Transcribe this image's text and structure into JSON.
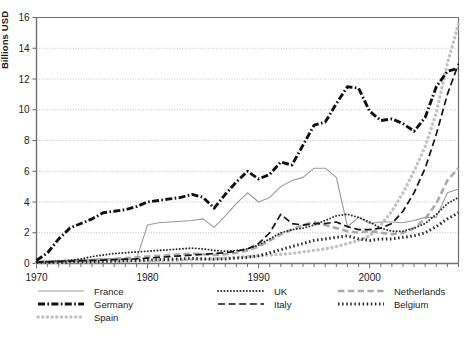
{
  "chart_data": {
    "type": "line",
    "title": "",
    "xlabel": "",
    "ylabel": "Billions USD",
    "xlim": [
      1970,
      2008
    ],
    "ylim": [
      0,
      16
    ],
    "yticks": [
      0,
      2,
      4,
      6,
      8,
      10,
      12,
      14,
      16
    ],
    "xticks_labeled": [
      1970,
      1980,
      1990,
      2000
    ],
    "xtick_step": 1,
    "grid": "horizontal-dotted",
    "legend_position": "below-axes",
    "x": [
      1970,
      1971,
      1972,
      1973,
      1974,
      1975,
      1976,
      1977,
      1978,
      1979,
      1980,
      1981,
      1982,
      1983,
      1984,
      1985,
      1986,
      1987,
      1988,
      1989,
      1990,
      1991,
      1992,
      1993,
      1994,
      1995,
      1996,
      1997,
      1998,
      1999,
      2000,
      2001,
      2002,
      2003,
      2004,
      2005,
      2006,
      2007,
      2008
    ],
    "series": [
      {
        "name": "France",
        "color": "#9a9a9a",
        "style": "solid-thin",
        "values": [
          0.15,
          0.18,
          0.2,
          0.22,
          0.25,
          0.28,
          0.3,
          0.3,
          0.28,
          0.3,
          2.5,
          2.65,
          2.7,
          2.75,
          2.8,
          2.9,
          2.35,
          3.1,
          3.9,
          4.6,
          4.0,
          4.3,
          5.0,
          5.4,
          5.6,
          6.2,
          6.2,
          5.6,
          2.4,
          3.0,
          2.6,
          2.7,
          2.7,
          2.65,
          2.8,
          3.0,
          3.0,
          4.6,
          4.85
        ]
      },
      {
        "name": "Germany",
        "color": "#111111",
        "style": "dash-dot-bold",
        "values": [
          0.2,
          0.7,
          1.6,
          2.3,
          2.6,
          2.9,
          3.3,
          3.4,
          3.5,
          3.7,
          4.0,
          4.1,
          4.2,
          4.3,
          4.5,
          4.3,
          3.6,
          4.5,
          5.3,
          6.0,
          5.5,
          5.8,
          6.6,
          6.4,
          7.7,
          9.0,
          9.2,
          10.4,
          11.5,
          11.4,
          9.9,
          9.3,
          9.4,
          9.1,
          8.6,
          9.5,
          11.5,
          12.5,
          12.7
        ]
      },
      {
        "name": "Spain",
        "color": "#c2c2c2",
        "style": "dotted-thick",
        "values": [
          0.05,
          0.06,
          0.07,
          0.08,
          0.09,
          0.1,
          0.12,
          0.13,
          0.14,
          0.15,
          0.16,
          0.18,
          0.2,
          0.22,
          0.25,
          0.28,
          0.3,
          0.35,
          0.4,
          0.45,
          0.5,
          0.55,
          0.6,
          0.65,
          0.75,
          0.85,
          0.95,
          1.1,
          1.3,
          1.5,
          1.8,
          2.5,
          3.4,
          4.6,
          6.0,
          7.6,
          9.8,
          13.0,
          15.6
        ]
      },
      {
        "name": "UK",
        "color": "#2b2b2b",
        "style": "dotted-fine",
        "values": [
          0.1,
          0.12,
          0.15,
          0.2,
          0.3,
          0.45,
          0.55,
          0.65,
          0.7,
          0.75,
          0.8,
          0.85,
          0.9,
          0.95,
          1.0,
          0.95,
          0.85,
          0.8,
          0.85,
          0.95,
          1.2,
          1.6,
          2.0,
          2.2,
          2.3,
          2.5,
          2.8,
          3.1,
          3.2,
          3.0,
          2.7,
          2.3,
          2.1,
          2.1,
          2.3,
          2.6,
          3.2,
          3.9,
          4.3
        ]
      },
      {
        "name": "Italy",
        "color": "#151515",
        "style": "dashed",
        "values": [
          0.08,
          0.1,
          0.12,
          0.15,
          0.18,
          0.2,
          0.22,
          0.25,
          0.28,
          0.3,
          0.35,
          0.4,
          0.45,
          0.5,
          0.55,
          0.6,
          0.65,
          0.7,
          0.8,
          0.95,
          1.3,
          2.0,
          3.2,
          2.6,
          2.5,
          2.6,
          2.6,
          2.7,
          2.4,
          2.2,
          2.2,
          2.3,
          2.6,
          3.4,
          4.6,
          6.2,
          8.4,
          11.0,
          13.0
        ]
      },
      {
        "name": "Netherlands",
        "color": "#aaaaaa",
        "style": "dashed-light",
        "values": [
          0.08,
          0.1,
          0.12,
          0.14,
          0.16,
          0.2,
          0.25,
          0.3,
          0.35,
          0.4,
          0.45,
          0.5,
          0.55,
          0.6,
          0.65,
          0.6,
          0.55,
          0.6,
          0.7,
          0.85,
          1.1,
          1.5,
          1.9,
          2.2,
          2.5,
          2.7,
          2.5,
          2.3,
          2.1,
          2.0,
          2.1,
          2.0,
          1.9,
          2.0,
          2.3,
          2.9,
          3.9,
          5.4,
          6.2
        ]
      },
      {
        "name": "Belgium",
        "color": "#2b2b2b",
        "style": "square-dots-bold",
        "values": [
          0.06,
          0.07,
          0.08,
          0.09,
          0.1,
          0.12,
          0.14,
          0.16,
          0.18,
          0.2,
          0.22,
          0.25,
          0.28,
          0.3,
          0.33,
          0.3,
          0.28,
          0.3,
          0.35,
          0.4,
          0.5,
          0.7,
          0.9,
          1.1,
          1.3,
          1.5,
          1.6,
          1.7,
          1.8,
          1.6,
          1.5,
          1.6,
          1.6,
          1.7,
          1.8,
          2.0,
          2.4,
          2.9,
          3.3
        ]
      }
    ]
  },
  "axes": {
    "ytick_labels": [
      "0",
      "2",
      "4",
      "6",
      "8",
      "10",
      "12",
      "14",
      "16"
    ],
    "xtick_labels": [
      "1970",
      "1980",
      "1990",
      "2000"
    ],
    "ylabel": "Billions USD"
  },
  "legend": {
    "entries": [
      {
        "label": "France",
        "key": "france"
      },
      {
        "label": "UK",
        "key": "uk"
      },
      {
        "label": "Netherlands",
        "key": "netherlands"
      },
      {
        "label": "Germany",
        "key": "germany"
      },
      {
        "label": "Italy",
        "key": "italy"
      },
      {
        "label": "Belgium",
        "key": "belgium"
      },
      {
        "label": "Spain",
        "key": "spain"
      }
    ]
  },
  "colors": {
    "axis": "#6f6f6f",
    "grid": "#b9b9b9",
    "text": "#1a1a1a",
    "background": "#ffffff"
  }
}
